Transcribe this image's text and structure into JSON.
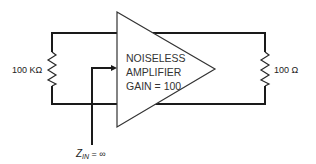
{
  "diagram": {
    "type": "circuit-schematic",
    "amplifier": {
      "line1": "NOISELESS",
      "line2": "AMPLIFIER",
      "line3": "GAIN = 100"
    },
    "left_resistor": {
      "label": "100 KΩ"
    },
    "right_resistor": {
      "label": "100 Ω"
    },
    "input_impedance": {
      "symbol": "Z",
      "subscript": "IN",
      "rest": " = ∞"
    }
  }
}
